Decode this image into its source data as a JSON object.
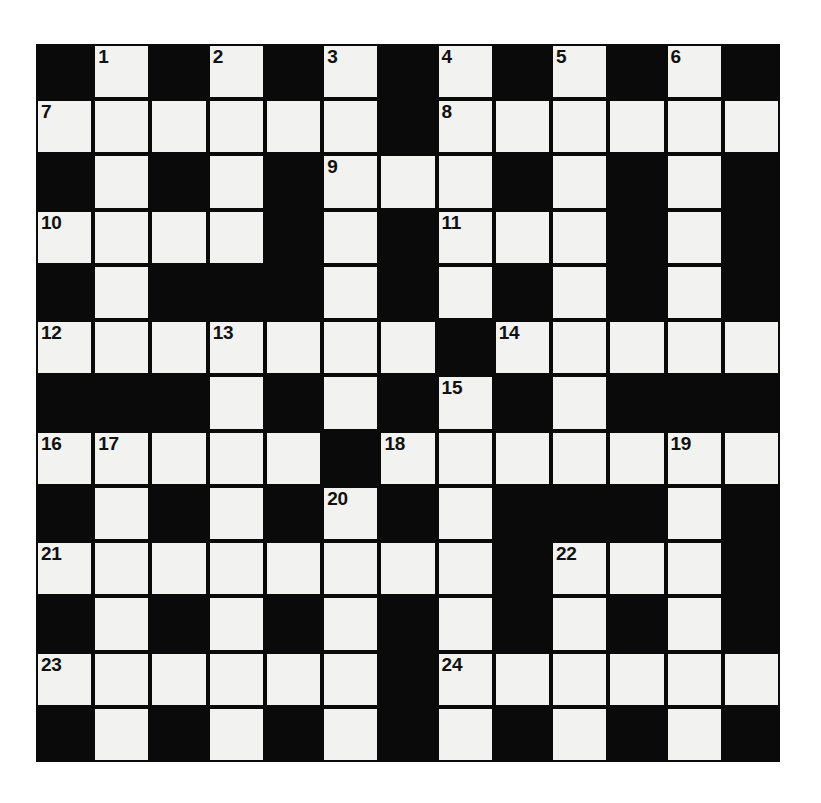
{
  "puzzle": {
    "type": "crossword-grid",
    "title": "Crossword Puzzle Grid",
    "columns": 13,
    "rows": 13,
    "cell_size_px": 57.2,
    "colors": {
      "block": "#0a0a0a",
      "cell": "#f2f2f0",
      "border": "#0a0a0a",
      "number_text": "#111111",
      "page_background": "#ffffff"
    },
    "legend": {
      "white": "open letter square",
      "black": "blocked square"
    },
    "grid": [
      [
        0,
        1,
        0,
        1,
        0,
        1,
        0,
        1,
        0,
        1,
        0,
        1,
        0
      ],
      [
        1,
        1,
        1,
        1,
        1,
        1,
        0,
        1,
        1,
        1,
        1,
        1,
        1
      ],
      [
        0,
        1,
        0,
        1,
        0,
        1,
        1,
        1,
        0,
        1,
        0,
        1,
        0
      ],
      [
        1,
        1,
        1,
        1,
        0,
        1,
        0,
        1,
        1,
        1,
        0,
        1,
        0
      ],
      [
        0,
        1,
        0,
        0,
        0,
        1,
        0,
        1,
        0,
        1,
        0,
        1,
        0
      ],
      [
        1,
        1,
        1,
        1,
        1,
        1,
        1,
        0,
        1,
        1,
        1,
        1,
        1
      ],
      [
        0,
        0,
        0,
        1,
        0,
        1,
        0,
        1,
        0,
        1,
        0,
        0,
        0
      ],
      [
        1,
        1,
        1,
        1,
        1,
        0,
        1,
        1,
        1,
        1,
        1,
        1,
        1
      ],
      [
        0,
        1,
        0,
        1,
        0,
        1,
        0,
        1,
        0,
        0,
        0,
        1,
        0
      ],
      [
        1,
        1,
        1,
        1,
        1,
        1,
        1,
        1,
        0,
        1,
        1,
        1,
        0
      ],
      [
        0,
        1,
        0,
        1,
        0,
        1,
        0,
        1,
        0,
        1,
        0,
        1,
        0
      ],
      [
        1,
        1,
        1,
        1,
        1,
        1,
        0,
        1,
        1,
        1,
        1,
        1,
        1
      ],
      [
        0,
        1,
        0,
        1,
        0,
        1,
        0,
        1,
        0,
        1,
        0,
        1,
        0
      ]
    ],
    "numbers": [
      {
        "row": 0,
        "col": 1,
        "label": "1"
      },
      {
        "row": 0,
        "col": 3,
        "label": "2"
      },
      {
        "row": 0,
        "col": 5,
        "label": "3"
      },
      {
        "row": 0,
        "col": 7,
        "label": "4"
      },
      {
        "row": 0,
        "col": 9,
        "label": "5"
      },
      {
        "row": 0,
        "col": 11,
        "label": "6"
      },
      {
        "row": 1,
        "col": 0,
        "label": "7"
      },
      {
        "row": 1,
        "col": 7,
        "label": "8"
      },
      {
        "row": 2,
        "col": 5,
        "label": "9"
      },
      {
        "row": 3,
        "col": 0,
        "label": "10"
      },
      {
        "row": 3,
        "col": 7,
        "label": "11"
      },
      {
        "row": 5,
        "col": 0,
        "label": "12"
      },
      {
        "row": 5,
        "col": 3,
        "label": "13"
      },
      {
        "row": 5,
        "col": 8,
        "label": "14"
      },
      {
        "row": 6,
        "col": 7,
        "label": "15"
      },
      {
        "row": 7,
        "col": 0,
        "label": "16"
      },
      {
        "row": 7,
        "col": 1,
        "label": "17"
      },
      {
        "row": 7,
        "col": 6,
        "label": "18"
      },
      {
        "row": 7,
        "col": 11,
        "label": "19"
      },
      {
        "row": 8,
        "col": 5,
        "label": "20"
      },
      {
        "row": 9,
        "col": 0,
        "label": "21"
      },
      {
        "row": 9,
        "col": 9,
        "label": "22"
      },
      {
        "row": 11,
        "col": 0,
        "label": "23"
      },
      {
        "row": 11,
        "col": 7,
        "label": "24"
      }
    ],
    "entries": []
  }
}
